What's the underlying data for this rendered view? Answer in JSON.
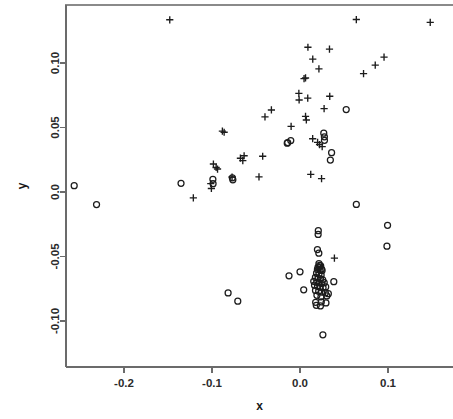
{
  "chart_data": {
    "type": "scatter",
    "title": "",
    "xlabel": "x",
    "ylabel": "y",
    "xlim": [
      -0.268,
      0.152
    ],
    "ylim": [
      -0.118,
      0.14
    ],
    "grid": false,
    "legend": "none",
    "x_ticks": [
      -0.2,
      -0.1,
      0.0,
      0.1
    ],
    "x_tick_labels": [
      "-0.2",
      "-0.1",
      "0.0",
      "0.1"
    ],
    "y_ticks": [
      0.1,
      0.05,
      0.0,
      -0.05,
      -0.1
    ],
    "y_tick_labels": [
      "0.10",
      "0.05",
      "0.0",
      "-0.05",
      "-0.10"
    ],
    "series": [
      {
        "name": "plus",
        "marker": "plus",
        "color": "#1c1c1c",
        "points": [
          [
            -0.148,
            0.1335
          ],
          [
            0.064,
            0.1337
          ],
          [
            0.148,
            0.1315
          ],
          [
            0.009,
            0.1122
          ],
          [
            0.0335,
            0.1108
          ],
          [
            0.0145,
            0.103
          ],
          [
            0.0955,
            0.1046
          ],
          [
            0.0215,
            0.0955
          ],
          [
            0.0855,
            0.0983
          ],
          [
            0.0046,
            0.0879
          ],
          [
            0.0063,
            0.0884
          ],
          [
            0.0722,
            0.0918
          ],
          [
            -0.0013,
            0.0764
          ],
          [
            -0.001,
            0.0713
          ],
          [
            0.0088,
            0.0728
          ],
          [
            0.0338,
            0.0742
          ],
          [
            -0.0325,
            0.0636
          ],
          [
            -0.0398,
            0.0582
          ],
          [
            0.0063,
            0.0586
          ],
          [
            0.0072,
            0.0558
          ],
          [
            0.0274,
            0.0646
          ],
          [
            -0.0101,
            0.0509
          ],
          [
            -0.0882,
            0.0472
          ],
          [
            -0.0862,
            0.0463
          ],
          [
            0.0144,
            0.0413
          ],
          [
            0.02,
            0.0385
          ],
          [
            0.0222,
            0.0368
          ],
          [
            0.0252,
            0.0352
          ],
          [
            -0.0635,
            0.0281
          ],
          [
            -0.0424,
            0.0277
          ],
          [
            -0.0677,
            0.0262
          ],
          [
            -0.065,
            0.0243
          ],
          [
            -0.0984,
            0.0217
          ],
          [
            -0.0953,
            0.019
          ],
          [
            -0.0937,
            0.0178
          ],
          [
            -0.0772,
            0.0116
          ],
          [
            -0.0466,
            0.0117
          ],
          [
            0.0122,
            0.0137
          ],
          [
            0.0245,
            0.0104
          ],
          [
            -0.1014,
            0.0065
          ],
          [
            -0.1007,
            0.0027
          ],
          [
            -0.1212,
            -0.0046
          ],
          [
            0.0391,
            -0.0513
          ]
        ]
      },
      {
        "name": "circle",
        "marker": "circle",
        "color": "#1c1c1c",
        "points": [
          [
            0.0525,
            0.0639
          ],
          [
            0.027,
            0.0456
          ],
          [
            0.0277,
            0.0428
          ],
          [
            0.0278,
            0.0401
          ],
          [
            -0.0105,
            0.0399
          ],
          [
            -0.014,
            0.0383
          ],
          [
            -0.0145,
            0.0378
          ],
          [
            0.0359,
            0.0305
          ],
          [
            0.0345,
            0.0248
          ],
          [
            -0.0769,
            0.011
          ],
          [
            -0.0763,
            0.0095
          ],
          [
            -0.099,
            0.0098
          ],
          [
            -0.0988,
            0.0064
          ],
          [
            -0.1352,
            0.0067
          ],
          [
            -0.2566,
            0.0049
          ],
          [
            -0.2312,
            -0.0097
          ],
          [
            0.064,
            -0.0096
          ],
          [
            0.0995,
            -0.0258
          ],
          [
            0.0208,
            -0.03
          ],
          [
            0.0206,
            -0.0329
          ],
          [
            0.0988,
            -0.042
          ],
          [
            0.0198,
            -0.0446
          ],
          [
            0.0214,
            -0.0474
          ],
          [
            0.0215,
            -0.0555
          ],
          [
            0.0222,
            -0.0568
          ],
          [
            0.0235,
            -0.0572
          ],
          [
            0.0205,
            -0.0583
          ],
          [
            0.0222,
            -0.0586
          ],
          [
            0.0245,
            -0.0597
          ],
          [
            0.0198,
            -0.06
          ],
          [
            0.0228,
            -0.0604
          ],
          [
            0.0251,
            -0.0608
          ],
          [
            0.0,
            -0.0619
          ],
          [
            0.0188,
            -0.0629
          ],
          [
            0.0215,
            -0.0637
          ],
          [
            0.024,
            -0.0644
          ],
          [
            -0.0125,
            -0.065
          ],
          [
            0.0175,
            -0.0662
          ],
          [
            0.0205,
            -0.0668
          ],
          [
            0.0232,
            -0.0673
          ],
          [
            0.0258,
            -0.0682
          ],
          [
            0.0156,
            -0.0692
          ],
          [
            0.019,
            -0.07
          ],
          [
            0.0218,
            -0.0705
          ],
          [
            0.0248,
            -0.071
          ],
          [
            0.0275,
            -0.0703
          ],
          [
            0.0384,
            -0.0695
          ],
          [
            0.0165,
            -0.0722
          ],
          [
            0.0198,
            -0.073
          ],
          [
            0.0228,
            -0.0738
          ],
          [
            0.0262,
            -0.0742
          ],
          [
            0.0292,
            -0.0736
          ],
          [
            0.0042,
            -0.0758
          ],
          [
            0.0176,
            -0.0763
          ],
          [
            0.0212,
            -0.077
          ],
          [
            0.0245,
            -0.0776
          ],
          [
            0.0288,
            -0.0782
          ],
          [
            -0.0817,
            -0.0782
          ],
          [
            0.0322,
            -0.0788
          ],
          [
            0.0192,
            -0.0801
          ],
          [
            0.0238,
            -0.0812
          ],
          [
            0.0305,
            -0.0806
          ],
          [
            -0.0707,
            -0.0846
          ],
          [
            0.0178,
            -0.0855
          ],
          [
            0.0242,
            -0.0852
          ],
          [
            0.0295,
            -0.086
          ],
          [
            0.0185,
            -0.0878
          ],
          [
            0.0232,
            -0.0883
          ],
          [
            0.026,
            -0.1107
          ]
        ]
      }
    ]
  },
  "axes": {
    "x_title": "x",
    "y_title": "y"
  }
}
